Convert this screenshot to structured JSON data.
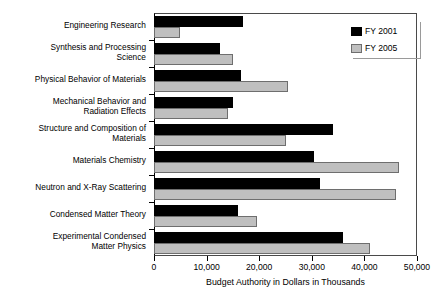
{
  "chart_data": {
    "type": "bar",
    "orientation": "horizontal",
    "title": "",
    "xlabel": "Budget Authority in Dollars in Thousands",
    "ylabel": "",
    "xlim": [
      0,
      50000
    ],
    "xticks": [
      0,
      10000,
      20000,
      30000,
      40000,
      50000
    ],
    "xtick_labels": [
      "0",
      "10,000",
      "20,000",
      "30,000",
      "40,000",
      "50,000"
    ],
    "grid": false,
    "legend_position": "top-right",
    "categories": [
      "Engineering Research",
      "Synthesis and Processing\nScience",
      "Physical Behavior of Materials",
      "Mechanical Behavior and\nRadiation Effects",
      "Structure and Composition of\nMaterials",
      "Materials Chemistry",
      "Neutron and X-Ray Scattering",
      "Condensed Matter Theory",
      "Experimental Condensed\nMatter Physics"
    ],
    "series": [
      {
        "name": "FY 2001",
        "color": "#000000",
        "values": [
          17000,
          12500,
          16500,
          15000,
          34000,
          30500,
          31500,
          16000,
          36000
        ]
      },
      {
        "name": "FY 2005",
        "color": "#bfbfbf",
        "values": [
          5000,
          15000,
          25500,
          14000,
          25000,
          46500,
          46000,
          19500,
          41000
        ]
      }
    ]
  },
  "legend": {
    "entries": [
      {
        "label": "FY 2001"
      },
      {
        "label": "FY 2005"
      }
    ]
  }
}
